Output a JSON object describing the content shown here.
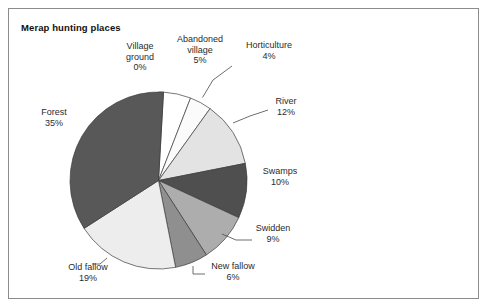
{
  "figure": {
    "title": "Merap hunting places",
    "border_color": "#8c8c8c",
    "background": "#ffffff"
  },
  "chart_data": {
    "type": "pie",
    "title": "Merap hunting places",
    "xlabel": "",
    "ylabel": "",
    "grid": false,
    "legend": "none (direct slice labels with leader lines)",
    "start_angle_deg": 0,
    "direction": "clockwise",
    "categories": [
      "Village ground",
      "Abandoned village",
      "Horticulture",
      "River",
      "Swamps",
      "Swidden",
      "New fallow",
      "Old fallow",
      "Forest"
    ],
    "values": [
      0,
      5,
      4,
      12,
      10,
      9,
      6,
      19,
      35
    ],
    "value_labels": [
      "0%",
      "5%",
      "4%",
      "12%",
      "10%",
      "9%",
      "6%",
      "19%",
      "35%"
    ],
    "unit": "%",
    "colors": [
      "#5a5a5a",
      "#ffffff",
      "#fbfbfb",
      "#e3e3e3",
      "#4f4f4f",
      "#adadad",
      "#8f8f8f",
      "#ededed",
      "#585858"
    ],
    "slices": [
      {
        "label": "Village ground",
        "value": 0,
        "display": "0%",
        "color": "#5a5a5a"
      },
      {
        "label": "Abandoned village",
        "value": 5,
        "display": "5%",
        "color": "#ffffff"
      },
      {
        "label": "Horticulture",
        "value": 4,
        "display": "4%",
        "color": "#fbfbfb"
      },
      {
        "label": "River",
        "value": 12,
        "display": "12%",
        "color": "#e3e3e3"
      },
      {
        "label": "Swamps",
        "value": 10,
        "display": "10%",
        "color": "#4f4f4f"
      },
      {
        "label": "Swidden",
        "value": 9,
        "display": "9%",
        "color": "#adadad"
      },
      {
        "label": "New fallow",
        "value": 6,
        "display": "6%",
        "color": "#8f8f8f"
      },
      {
        "label": "Old fallow",
        "value": 19,
        "display": "19%",
        "color": "#ededed"
      },
      {
        "label": "Forest",
        "value": 35,
        "display": "35%",
        "color": "#585858"
      }
    ]
  },
  "labels": {
    "village_ground": {
      "name": "Village",
      "name2": "ground",
      "value": "0%"
    },
    "abandoned_village": {
      "name": "Abandoned",
      "name2": "village",
      "value": "5%"
    },
    "horticulture": {
      "name": "Horticulture",
      "value": "4%"
    },
    "river": {
      "name": "River",
      "value": "12%"
    },
    "swamps": {
      "name": "Swamps",
      "value": "10%"
    },
    "swidden": {
      "name": "Swidden",
      "value": "9%"
    },
    "new_fallow": {
      "name": "New fallow",
      "value": "6%"
    },
    "old_fallow": {
      "name": "Old fallow",
      "value": "19%"
    },
    "forest": {
      "name": "Forest",
      "value": "35%"
    }
  }
}
